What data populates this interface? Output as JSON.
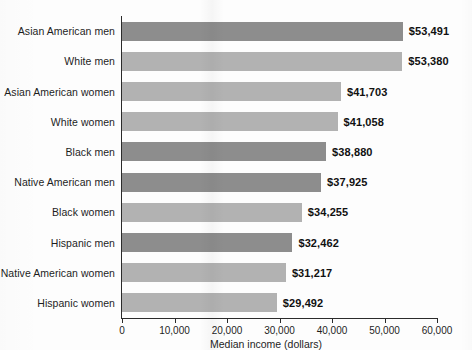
{
  "chart_data": {
    "type": "bar",
    "orientation": "horizontal",
    "title": "",
    "xlabel": "Median income (dollars)",
    "ylabel": "",
    "xlim": [
      0,
      60000
    ],
    "xticks": [
      "0",
      "10,000",
      "20,000",
      "30,000",
      "40,000",
      "50,000",
      "60,000"
    ],
    "xtick_values": [
      0,
      10000,
      20000,
      30000,
      40000,
      50000,
      60000
    ],
    "grid": false,
    "legend": "none",
    "categories": [
      "Asian American men",
      "White men",
      "Asian American women",
      "White women",
      "Black men",
      "Native American men",
      "Black women",
      "Hispanic men",
      "Native American women",
      "Hispanic women"
    ],
    "values": [
      53491,
      53380,
      41703,
      41058,
      38880,
      37925,
      34255,
      32462,
      31217,
      29492
    ],
    "value_labels": [
      "$53,491",
      "$53,380",
      "$41,703",
      "$41,058",
      "$38,880",
      "$37,925",
      "$34,255",
      "$32,462",
      "$31,217",
      "$29,492"
    ],
    "groups": [
      "men",
      "women",
      "women",
      "women",
      "men",
      "men",
      "women",
      "men",
      "women",
      "women"
    ],
    "colors": {
      "men": "#8d8d8d",
      "women": "#b2b2b2",
      "axis": "#2b2b2b",
      "text": "#1d1d1d",
      "background": "#fdfdfd"
    }
  }
}
